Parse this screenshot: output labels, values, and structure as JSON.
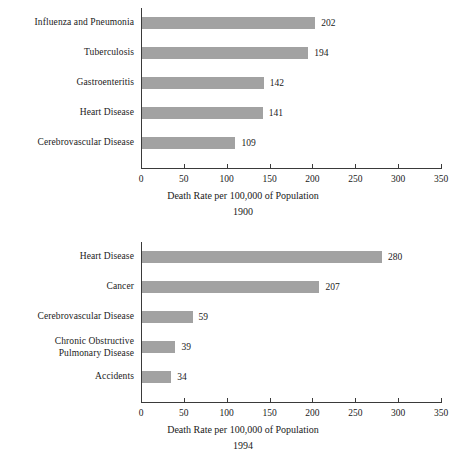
{
  "page": {
    "background": "#ffffff",
    "bar_color": "#a2a2a2",
    "axis_color": "#3a3a3a",
    "text_color": "#1a1a1a"
  },
  "charts": [
    {
      "id": "chart-1900",
      "year": "1900",
      "axis_title": "Death Rate per 100,000 of Population",
      "ticks": [
        "0",
        "50",
        "100",
        "150",
        "200",
        "250",
        "300",
        "350"
      ],
      "rows": [
        {
          "label": "Influenza and Pneumonia",
          "label_lines": [
            "Influenza and Pneumonia"
          ],
          "value": 202,
          "value_label": "202"
        },
        {
          "label": "Tuberculosis",
          "label_lines": [
            "Tuberculosis"
          ],
          "value": 194,
          "value_label": "194"
        },
        {
          "label": "Gastroenteritis",
          "label_lines": [
            "Gastroenteritis"
          ],
          "value": 142,
          "value_label": "142"
        },
        {
          "label": "Heart Disease",
          "label_lines": [
            "Heart Disease"
          ],
          "value": 141,
          "value_label": "141"
        },
        {
          "label": "Cerebrovascular Disease",
          "label_lines": [
            "Cerebrovascular Disease"
          ],
          "value": 109,
          "value_label": "109"
        }
      ]
    },
    {
      "id": "chart-1994",
      "year": "1994",
      "axis_title": "Death Rate per 100,000 of Population",
      "ticks": [
        "0",
        "50",
        "100",
        "150",
        "200",
        "250",
        "300",
        "350"
      ],
      "rows": [
        {
          "label": "Heart Disease",
          "label_lines": [
            "Heart Disease"
          ],
          "value": 280,
          "value_label": "280"
        },
        {
          "label": "Cancer",
          "label_lines": [
            "Cancer"
          ],
          "value": 207,
          "value_label": "207"
        },
        {
          "label": "Cerebrovascular Disease",
          "label_lines": [
            "Cerebrovascular Disease"
          ],
          "value": 59,
          "value_label": "59"
        },
        {
          "label": "Chronic Obstructive Pulmonary Disease",
          "label_lines": [
            "Chronic Obstructive",
            "Pulmonary Disease"
          ],
          "value": 39,
          "value_label": "39"
        },
        {
          "label": "Accidents",
          "label_lines": [
            "Accidents"
          ],
          "value": 34,
          "value_label": "34"
        }
      ]
    }
  ],
  "chart_data": [
    {
      "type": "bar",
      "orientation": "horizontal",
      "title": "1900",
      "xlabel": "Death Rate per 100,000 of Population",
      "ylabel": "",
      "categories": [
        "Influenza and Pneumonia",
        "Tuberculosis",
        "Gastroenteritis",
        "Heart Disease",
        "Cerebrovascular Disease"
      ],
      "values": [
        202,
        194,
        142,
        141,
        109
      ],
      "data_labels": [
        "202",
        "194",
        "142",
        "141",
        "109"
      ],
      "xlim": [
        0,
        350
      ],
      "xticks": [
        0,
        50,
        100,
        150,
        200,
        250,
        300,
        350
      ],
      "grid": false,
      "legend": false,
      "bar_color": "#a2a2a2"
    },
    {
      "type": "bar",
      "orientation": "horizontal",
      "title": "1994",
      "xlabel": "Death Rate per 100,000 of Population",
      "ylabel": "",
      "categories": [
        "Heart Disease",
        "Cancer",
        "Cerebrovascular Disease",
        "Chronic Obstructive Pulmonary Disease",
        "Accidents"
      ],
      "values": [
        280,
        207,
        59,
        39,
        34
      ],
      "data_labels": [
        "280",
        "207",
        "59",
        "39",
        "34"
      ],
      "xlim": [
        0,
        350
      ],
      "xticks": [
        0,
        50,
        100,
        150,
        200,
        250,
        300,
        350
      ],
      "grid": false,
      "legend": false,
      "bar_color": "#a2a2a2"
    }
  ]
}
